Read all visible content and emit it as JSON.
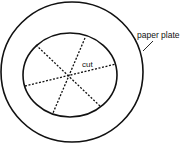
{
  "diagram": {
    "title": "",
    "labels": {
      "plate": "paper plate",
      "cut": "cut"
    },
    "colors": {
      "stroke": "#111111",
      "background": "#ffffff"
    }
  }
}
